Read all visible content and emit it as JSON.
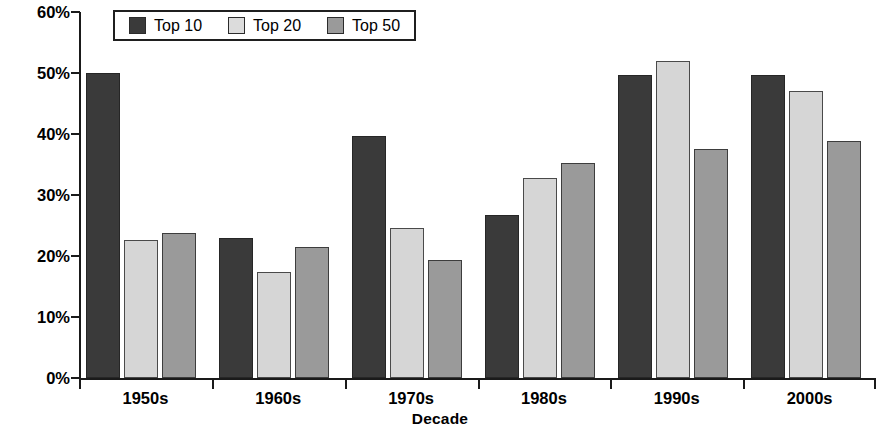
{
  "chart_data": {
    "type": "bar",
    "title": "",
    "xlabel": "Decade",
    "ylabel": "Proportion of authors who are women",
    "categories": [
      "1950s",
      "1960s",
      "1970s",
      "1980s",
      "1990s",
      "2000s"
    ],
    "series": [
      {
        "name": "Top 10",
        "color": "#3a3a3a",
        "values": [
          50.0,
          23.0,
          39.7,
          26.8,
          49.7,
          49.6
        ]
      },
      {
        "name": "Top 20",
        "color": "#d6d6d6",
        "values": [
          22.7,
          17.3,
          24.6,
          32.8,
          51.9,
          47.0
        ]
      },
      {
        "name": "Top 50",
        "color": "#9a9a9a",
        "values": [
          23.7,
          21.5,
          19.4,
          35.2,
          37.6,
          38.8
        ]
      }
    ],
    "ylim": [
      0,
      60
    ],
    "ytick_values": [
      0,
      10,
      20,
      30,
      40,
      50,
      60
    ],
    "ytick_labels": [
      "0%",
      "10%",
      "20%",
      "30%",
      "40%",
      "50%",
      "60%"
    ],
    "grid": false,
    "legend_position": "top-left-inside",
    "value_suffix": "%"
  },
  "axes": {
    "y_title": "Proportion of authors who are women",
    "x_title": "Decade"
  },
  "legend": {
    "entries": [
      {
        "label": "Top 10",
        "swatch": "top10"
      },
      {
        "label": "Top 20",
        "swatch": "top20"
      },
      {
        "label": "Top 50",
        "swatch": "top50"
      }
    ]
  }
}
